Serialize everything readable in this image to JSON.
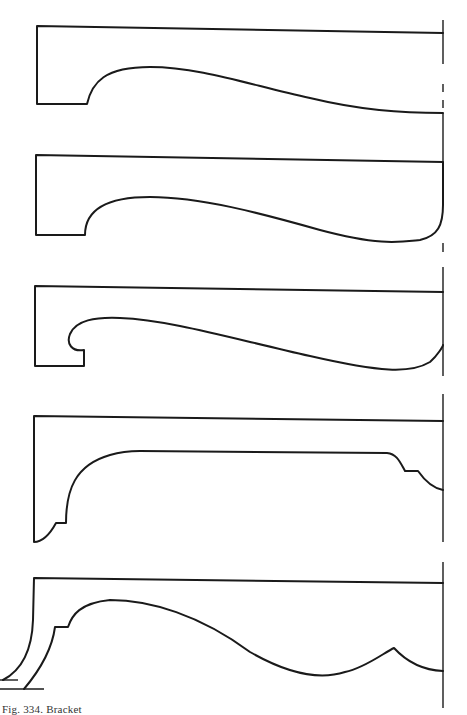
{
  "figure": {
    "caption": "Fig. 334. Bracket",
    "stroke_color": "#1a1a1a",
    "background": "#ffffff",
    "profiles": [
      {
        "id": 1,
        "name": "bracket-profile-1",
        "description": "Cyma curve bracket with square step at left"
      },
      {
        "id": 2,
        "name": "bracket-profile-2",
        "description": "Cyma curve bracket with rounded toe at right"
      },
      {
        "id": 3,
        "name": "bracket-profile-3",
        "description": "Scroll bracket with notched hook at left"
      },
      {
        "id": 4,
        "name": "bracket-profile-4",
        "description": "Long flat-soffit bracket with stepped ends"
      },
      {
        "id": 5,
        "name": "bracket-profile-5",
        "description": "Wave-profile bracket with raked leg and cusp"
      }
    ]
  }
}
